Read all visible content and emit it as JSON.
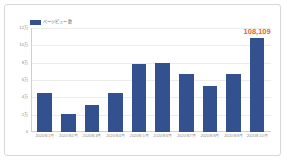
{
  "chart_data": {
    "type": "bar",
    "title": "",
    "subtitle": "",
    "xlabel": "",
    "ylabel": "",
    "categories": [
      "2020年1月",
      "2020年2月",
      "2020年3月",
      "2020年4月",
      "2020年5月",
      "2020年6月",
      "2020年7月",
      "2020年8月",
      "2020年9月",
      "2020年10月"
    ],
    "values": [
      45000,
      21000,
      31000,
      45000,
      79000,
      80000,
      67000,
      53000,
      67000,
      108109
    ],
    "series": [
      {
        "name": "ページビュー数",
        "color": "#33508f",
        "values": [
          45000,
          21000,
          31000,
          45000,
          79000,
          80000,
          67000,
          53000,
          67000,
          108109
        ]
      }
    ],
    "ylim": [
      0,
      120000
    ],
    "ytick_values": [
      120000,
      100000,
      80000,
      60000,
      40000,
      20000,
      0
    ],
    "ytick_labels": [
      "12万",
      "10万",
      "8万",
      "6万",
      "4万",
      "2万",
      "0"
    ],
    "grid": true,
    "legend_position": "top-left",
    "annotations": [
      {
        "text": "108,109",
        "category": "2020年10月",
        "value": 108109,
        "color": "#e8603c"
      }
    ]
  },
  "legend": {
    "label": "ページビュー数",
    "swatch_color": "#33508f"
  },
  "colors": {
    "bar": "#33508f",
    "highlight": "#e8603c",
    "grid": "#ececec",
    "axis": "#cfcfcf",
    "tick_text": "#8a8a8a",
    "frame": "#d8d8d8",
    "background": "#ffffff"
  }
}
